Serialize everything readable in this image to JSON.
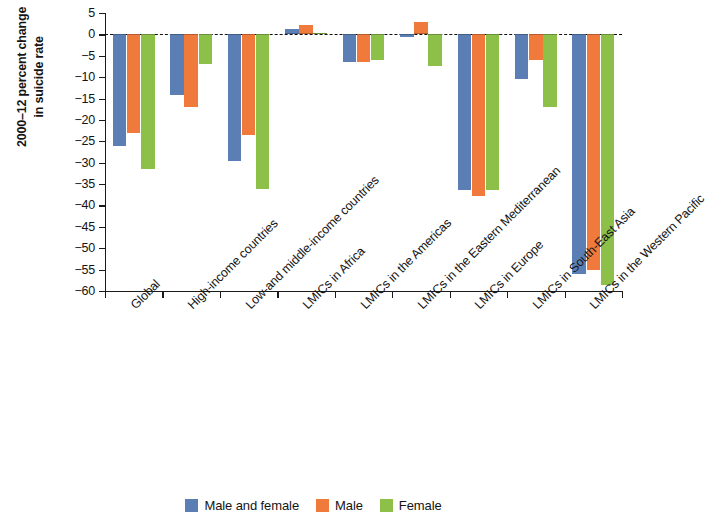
{
  "chart_data": {
    "type": "bar",
    "title": "",
    "subtitle": "",
    "xlabel": "",
    "ylabel": "2000–12 percent change\nin suicide rate",
    "ylabel_lines": [
      "2000–12 percent change",
      "in suicide rate"
    ],
    "ylim": [
      -60,
      5
    ],
    "ytick_labels": [
      "5",
      "0",
      "−5",
      "−10",
      "−15",
      "−20",
      "−25",
      "−30",
      "−35",
      "−40",
      "−45",
      "−50",
      "−55",
      "−60"
    ],
    "ytick_values": [
      5,
      0,
      -5,
      -10,
      -15,
      -20,
      -25,
      -30,
      -35,
      -40,
      -45,
      -50,
      -55,
      -60
    ],
    "grid": false,
    "zero_line": true,
    "zero_line_style": "dashed",
    "legend_position": "bottom",
    "categories": [
      "Global",
      "High-income countries",
      "Low-and middle-income countries",
      "LMICs in Africa",
      "LMICs in the Americas",
      "LMICs in the Eastern Mediterranean",
      "LMICs in Europe",
      "LMICs in South-East Asia",
      "LMICs in the Western Pacific"
    ],
    "series": [
      {
        "name": "Male and female",
        "color": "#5B7FB4",
        "values": [
          -26.0,
          -14.2,
          -29.5,
          1.2,
          -6.5,
          -0.6,
          -36.5,
          -10.5,
          -56.0
        ]
      },
      {
        "name": "Male",
        "color": "#F0793C",
        "values": [
          -23.0,
          -17.0,
          -23.5,
          2.2,
          -6.5,
          3.0,
          -37.8,
          -6.0,
          -55.0
        ]
      },
      {
        "name": "Female",
        "color": "#8CC048",
        "values": [
          -31.5,
          -7.0,
          -36.2,
          0.4,
          -6.0,
          -7.5,
          -36.5,
          -17.0,
          -58.5
        ]
      }
    ]
  },
  "legend": {
    "items": [
      {
        "label": "Male and female",
        "color": "#5B7FB4"
      },
      {
        "label": "Male",
        "color": "#F0793C"
      },
      {
        "label": "Female",
        "color": "#8CC048"
      }
    ]
  }
}
